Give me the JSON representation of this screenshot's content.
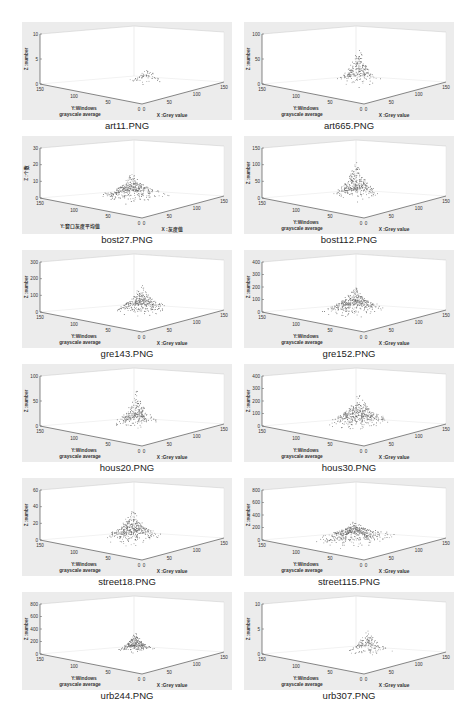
{
  "figure_caption_top": "",
  "panels": [
    {
      "id": "art11",
      "caption": "art11.PNG",
      "zlabel": "Z :number",
      "ylabel1": "Y:Windows",
      "ylabel2": "grayscale average",
      "xlabel": "X :Grey value",
      "zticks": [
        "0",
        "5",
        "10"
      ],
      "peak": {
        "x": 0.62,
        "y": 0.45,
        "h": 0.35,
        "spread": 0.18,
        "density": 60
      }
    },
    {
      "id": "art665",
      "caption": "art665.PNG",
      "zlabel": "Z :number",
      "ylabel1": "Y:Windows",
      "ylabel2": "grayscale average",
      "xlabel": "X :Grey value",
      "zticks": [
        "0",
        "50",
        "100"
      ],
      "peak": {
        "x": 0.55,
        "y": 0.5,
        "h": 0.8,
        "spread": 0.2,
        "density": 220
      }
    },
    {
      "id": "bost27",
      "caption": "bost27.PNG",
      "zlabel": "Z :个数",
      "ylabel1": "Y:窗口灰度平均值",
      "ylabel2": "",
      "xlabel": "X :灰度值",
      "zticks": [
        "0",
        "10",
        "20",
        "30"
      ],
      "peak": {
        "x": 0.5,
        "y": 0.5,
        "h": 0.55,
        "spread": 0.28,
        "density": 380
      }
    },
    {
      "id": "bost112",
      "caption": "bost112.PNG",
      "zlabel": "Z :number",
      "ylabel1": "Y:Windows",
      "ylabel2": "grayscale average",
      "xlabel": "X :Grey value",
      "zticks": [
        "0",
        "50",
        "100",
        "150"
      ],
      "peak": {
        "x": 0.52,
        "y": 0.5,
        "h": 0.8,
        "spread": 0.22,
        "density": 320
      }
    },
    {
      "id": "gre143",
      "caption": "gre143.PNG",
      "zlabel": "Z :number",
      "ylabel1": "Y:Windows",
      "ylabel2": "grayscale average",
      "xlabel": "X :Grey value",
      "zticks": [
        "0",
        "100",
        "200",
        "300"
      ],
      "peak": {
        "x": 0.55,
        "y": 0.45,
        "h": 0.6,
        "spread": 0.25,
        "density": 330
      }
    },
    {
      "id": "gre152",
      "caption": "gre152.PNG",
      "zlabel": "Z :number",
      "ylabel1": "Y:Windows",
      "ylabel2": "grayscale average",
      "xlabel": "X :Grey value",
      "zticks": [
        "0",
        "100",
        "200",
        "300",
        "400"
      ],
      "peak": {
        "x": 0.5,
        "y": 0.5,
        "h": 0.6,
        "spread": 0.27,
        "density": 380
      }
    },
    {
      "id": "hous20",
      "caption": "hous20.PNG",
      "zlabel": "Z :number",
      "ylabel1": "Y:Windows",
      "ylabel2": "grayscale average",
      "xlabel": "X :Grey value",
      "zticks": [
        "0",
        "50",
        "100"
      ],
      "peak": {
        "x": 0.55,
        "y": 0.5,
        "h": 0.75,
        "spread": 0.2,
        "density": 260
      }
    },
    {
      "id": "hous30",
      "caption": "hous30.PNG",
      "zlabel": "Z :number",
      "ylabel1": "Y:Windows",
      "ylabel2": "grayscale average",
      "xlabel": "X :Grey value",
      "zticks": [
        "0",
        "100",
        "200",
        "300",
        "400"
      ],
      "peak": {
        "x": 0.55,
        "y": 0.5,
        "h": 0.7,
        "spread": 0.28,
        "density": 400
      }
    },
    {
      "id": "street18",
      "caption": "street18.PNG",
      "zlabel": "Z :number",
      "ylabel1": "Y:Windows",
      "ylabel2": "grayscale average",
      "xlabel": "X :Grey value",
      "zticks": [
        "0",
        "20",
        "40",
        "60"
      ],
      "peak": {
        "x": 0.5,
        "y": 0.5,
        "h": 0.7,
        "spread": 0.26,
        "density": 380
      }
    },
    {
      "id": "street115",
      "caption": "street115.PNG",
      "zlabel": "Z :number",
      "ylabel1": "Y:Windows",
      "ylabel2": "grayscale average",
      "xlabel": "X :Grey value",
      "zticks": [
        "0",
        "200",
        "400",
        "600",
        "800"
      ],
      "peak": {
        "x": 0.5,
        "y": 0.5,
        "h": 0.4,
        "spread": 0.35,
        "density": 450
      }
    },
    {
      "id": "urb244",
      "caption": "urb244.PNG",
      "zlabel": "Z :number",
      "ylabel1": "Y:Windows",
      "ylabel2": "grayscale average",
      "xlabel": "X :Grey value",
      "zticks": [
        "0",
        "200",
        "400",
        "600",
        "800"
      ],
      "peak": {
        "x": 0.6,
        "y": 0.55,
        "h": 0.4,
        "spread": 0.16,
        "density": 260
      }
    },
    {
      "id": "urb307",
      "caption": "urb307.PNG",
      "zlabel": "Z :number",
      "ylabel1": "Y:Windows",
      "ylabel2": "grayscale average",
      "xlabel": "X :Grey value",
      "zticks": [
        "0",
        "5",
        "10"
      ],
      "peak": {
        "x": 0.6,
        "y": 0.45,
        "h": 0.55,
        "spread": 0.2,
        "density": 150
      }
    }
  ],
  "chart_data": [
    {
      "type": "scatter",
      "title": "art11.PNG",
      "xlabel": "X :Grey value",
      "ylabel": "Y:Windows grayscale average",
      "zlabel": "Z :number",
      "xlim": [
        0,
        150
      ],
      "ylim": [
        0,
        150
      ],
      "zlim": [
        0,
        10
      ],
      "xticks": [
        0,
        50,
        100,
        150
      ],
      "yticks": [
        0,
        50,
        100,
        150
      ],
      "zticks": [
        0,
        5,
        10
      ]
    },
    {
      "type": "scatter",
      "title": "art665.PNG",
      "xlabel": "X :Grey value",
      "ylabel": "Y:Windows grayscale average",
      "zlabel": "Z :number",
      "xlim": [
        0,
        150
      ],
      "ylim": [
        0,
        150
      ],
      "zlim": [
        0,
        100
      ],
      "xticks": [
        0,
        50,
        100,
        150
      ],
      "yticks": [
        0,
        50,
        100,
        150
      ],
      "zticks": [
        0,
        50,
        100
      ]
    },
    {
      "type": "scatter",
      "title": "bost27.PNG",
      "xlabel": "X :灰度值",
      "ylabel": "Y:窗口灰度平均值",
      "zlabel": "Z :个数",
      "xlim": [
        0,
        150
      ],
      "ylim": [
        0,
        150
      ],
      "zlim": [
        0,
        30
      ],
      "xticks": [
        0,
        50,
        100,
        150
      ],
      "yticks": [
        0,
        50,
        100,
        150
      ],
      "zticks": [
        0,
        10,
        20,
        30
      ]
    },
    {
      "type": "scatter",
      "title": "bost112.PNG",
      "xlabel": "X :Grey value",
      "ylabel": "Y:Windows grayscale average",
      "zlabel": "Z :number",
      "xlim": [
        0,
        150
      ],
      "ylim": [
        0,
        150
      ],
      "zlim": [
        0,
        150
      ],
      "xticks": [
        0,
        50,
        100,
        150
      ],
      "yticks": [
        0,
        50,
        100,
        150
      ],
      "zticks": [
        0,
        50,
        100,
        150
      ]
    },
    {
      "type": "scatter",
      "title": "gre143.PNG",
      "xlabel": "X :Grey value",
      "ylabel": "Y:Windows grayscale average",
      "zlabel": "Z :number",
      "xlim": [
        0,
        150
      ],
      "ylim": [
        0,
        150
      ],
      "zlim": [
        0,
        300
      ],
      "xticks": [
        0,
        50,
        100,
        150
      ],
      "yticks": [
        0,
        50,
        100,
        150
      ],
      "zticks": [
        0,
        100,
        200,
        300
      ]
    },
    {
      "type": "scatter",
      "title": "gre152.PNG",
      "xlabel": "X :Grey value",
      "ylabel": "Y:Windows grayscale average",
      "zlabel": "Z :number",
      "xlim": [
        0,
        150
      ],
      "ylim": [
        0,
        150
      ],
      "zlim": [
        0,
        400
      ],
      "xticks": [
        0,
        50,
        100,
        150
      ],
      "yticks": [
        0,
        50,
        100,
        150
      ],
      "zticks": [
        0,
        100,
        200,
        300,
        400
      ]
    },
    {
      "type": "scatter",
      "title": "hous20.PNG",
      "xlabel": "X :Grey value",
      "ylabel": "Y:Windows grayscale average",
      "zlabel": "Z :number",
      "xlim": [
        0,
        150
      ],
      "ylim": [
        0,
        150
      ],
      "zlim": [
        0,
        100
      ],
      "xticks": [
        0,
        50,
        100,
        150
      ],
      "yticks": [
        0,
        50,
        100,
        150
      ],
      "zticks": [
        0,
        50,
        100
      ]
    },
    {
      "type": "scatter",
      "title": "hous30.PNG",
      "xlabel": "X :Grey value",
      "ylabel": "Y:Windows grayscale average",
      "zlabel": "Z :number",
      "xlim": [
        0,
        150
      ],
      "ylim": [
        0,
        150
      ],
      "zlim": [
        0,
        400
      ],
      "xticks": [
        0,
        50,
        100,
        150
      ],
      "yticks": [
        0,
        50,
        100,
        150
      ],
      "zticks": [
        0,
        100,
        200,
        300,
        400
      ]
    },
    {
      "type": "scatter",
      "title": "street18.PNG",
      "xlabel": "X :Grey value",
      "ylabel": "Y:Windows grayscale average",
      "zlabel": "Z :number",
      "xlim": [
        0,
        150
      ],
      "ylim": [
        0,
        150
      ],
      "zlim": [
        0,
        60
      ],
      "xticks": [
        0,
        50,
        100,
        150
      ],
      "yticks": [
        0,
        50,
        100,
        150
      ],
      "zticks": [
        0,
        20,
        40,
        60
      ]
    },
    {
      "type": "scatter",
      "title": "street115.PNG",
      "xlabel": "X :Grey value",
      "ylabel": "Y:Windows grayscale average",
      "zlabel": "Z :number",
      "xlim": [
        0,
        150
      ],
      "ylim": [
        0,
        150
      ],
      "zlim": [
        0,
        800
      ],
      "xticks": [
        0,
        50,
        100,
        150
      ],
      "yticks": [
        0,
        50,
        100,
        150
      ],
      "zticks": [
        0,
        200,
        400,
        600,
        800
      ]
    },
    {
      "type": "scatter",
      "title": "urb244.PNG",
      "xlabel": "X :Grey value",
      "ylabel": "Y:Windows grayscale average",
      "zlabel": "Z :number",
      "xlim": [
        0,
        150
      ],
      "ylim": [
        0,
        150
      ],
      "zlim": [
        0,
        800
      ],
      "xticks": [
        0,
        50,
        100,
        150
      ],
      "yticks": [
        0,
        50,
        100,
        150
      ],
      "zticks": [
        0,
        200,
        400,
        600,
        800
      ]
    },
    {
      "type": "scatter",
      "title": "urb307.PNG",
      "xlabel": "X :Grey value",
      "ylabel": "Y:Windows grayscale average",
      "zlabel": "Z :number",
      "xlim": [
        0,
        150
      ],
      "ylim": [
        0,
        150
      ],
      "zlim": [
        0,
        10
      ],
      "xticks": [
        0,
        50,
        100,
        150
      ],
      "yticks": [
        0,
        50,
        100,
        150
      ],
      "zticks": [
        0,
        5,
        10
      ]
    }
  ],
  "axis_ticks": {
    "x": [
      "0",
      "50",
      "100",
      "150"
    ],
    "y": [
      "0",
      "50",
      "100",
      "150"
    ]
  }
}
